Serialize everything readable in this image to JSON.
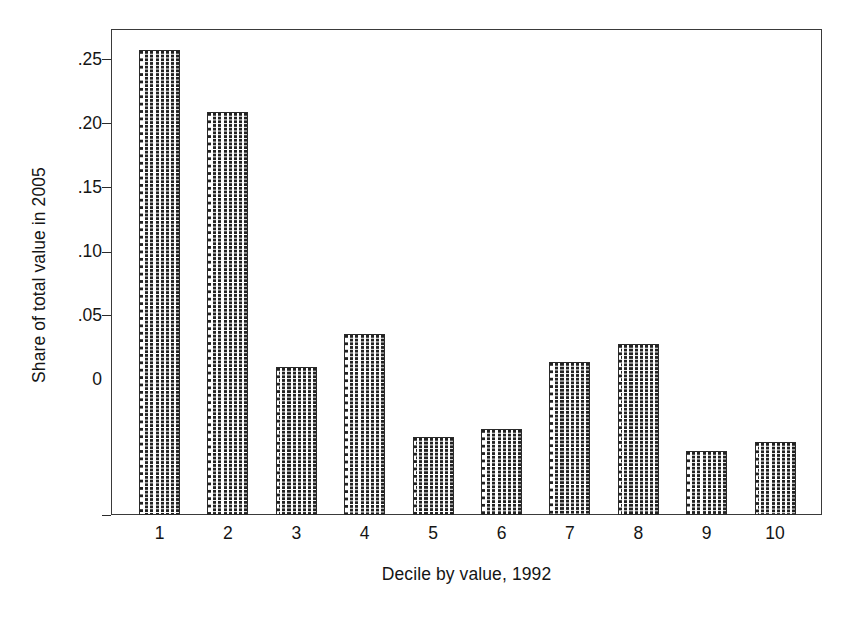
{
  "chart_data": {
    "type": "bar",
    "title": "",
    "xlabel": "Decile by value, 1992",
    "ylabel": "Share of total value in 2005",
    "categories": [
      "1",
      "2",
      "3",
      "4",
      "5",
      "6",
      "7",
      "8",
      "9",
      "10"
    ],
    "values": [
      0.255,
      0.221,
      0.081,
      0.099,
      0.043,
      0.047,
      0.084,
      0.094,
      0.035,
      0.04
    ],
    "ylim": [
      0,
      0.27
    ],
    "ytick_values": [
      0,
      0.05,
      0.1,
      0.15,
      0.2,
      0.25
    ],
    "ytick_labels": [
      "0",
      ".05",
      ".10",
      ".15",
      ".20",
      ".25"
    ],
    "grid": false,
    "legend": false,
    "legend_position": "none",
    "series": [
      {
        "name": "Share of total value in 2005",
        "values": [
          0.255,
          0.221,
          0.081,
          0.099,
          0.043,
          0.047,
          0.084,
          0.094,
          0.035,
          0.04
        ]
      }
    ],
    "style": {
      "bar_fill": "#ffffff",
      "bar_pattern": "vertical-dashed-hatch",
      "bar_edge_color": "#2a2a2a",
      "axis_color": "#3a3a3a",
      "text_color": "#151515",
      "background": "#ffffff"
    }
  }
}
